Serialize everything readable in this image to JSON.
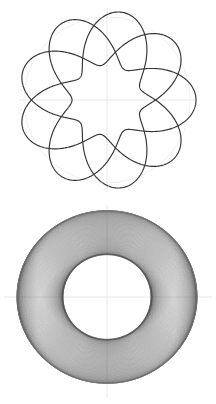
{
  "figure": {
    "background_color": "#ffffff",
    "curve_color": "#333333",
    "strand_color": "#555555",
    "axis_color": "#e8e8e8",
    "guide_circle_color": "#f0f0f0",
    "panel_count": 2
  },
  "panels": [
    {
      "name": "sparse-trefoil-projection",
      "label": "Top view: 3-lobed torus knot",
      "center_x": 107,
      "center_y": 100,
      "outer_radius": 89,
      "guide_radius": 83,
      "axis_x_range": [
        18,
        196
      ],
      "axis_y_range": [
        8,
        192
      ],
      "windings": 3,
      "line_width": 1.15
    },
    {
      "name": "dense-torus-winding",
      "label": "Bottom view: dense torus winding",
      "center_x": 107,
      "center_y": 95,
      "outer_radius": 90,
      "inner_radius": 45,
      "axis_x_range": [
        4,
        212
      ],
      "axis_y_range": [
        3,
        196
      ],
      "windings": 160,
      "line_width": 0.45
    }
  ],
  "chart_data": {
    "type": "line",
    "subtitle": "",
    "xlabel": "",
    "ylabel": "",
    "grid": false,
    "legend": null,
    "series": [
      {
        "name": "sparse-torus-knot",
        "panel": "top",
        "parametric": "x = (R + r*cos(q*t))*cos(p*t), y = (R + r*cos(q*t))*sin(p*t)",
        "R": 62,
        "r": 27,
        "p": 1,
        "q": 3,
        "t_range": [
          0,
          6.283185307
        ],
        "samples": 720,
        "color": "#333333",
        "stroke_width": 1.15
      },
      {
        "name": "dense-torus-winding",
        "panel": "bottom",
        "parametric": "x = (R + r*cos(q*t))*cos(p*t), y = (R + r*cos(q*t))*sin(p*t)",
        "R": 67,
        "r": 23,
        "p": 1,
        "q": 160,
        "t_range": [
          0,
          6.283185307
        ],
        "samples": 9600,
        "color": "#555555",
        "stroke_width": 0.45
      }
    ],
    "xlim": [
      -108,
      108
    ],
    "ylim": [
      -101,
      101
    ]
  }
}
